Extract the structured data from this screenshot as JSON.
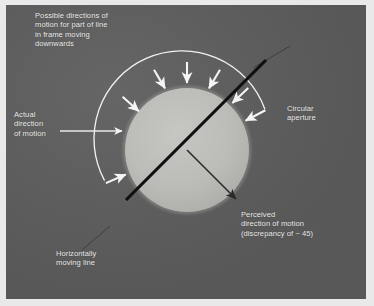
{
  "figure": {
    "panel_color": "#5d5d5d",
    "mount_color": "#e9e9e9",
    "aperture_fill": "#b9b9b6",
    "arc_color": "#f2f2f2",
    "arrow_color": "#f5f5f5",
    "line_color": "#111111",
    "percept_arrow_color": "#2b2b2b",
    "text_color": "#f0f0f0"
  },
  "labels": {
    "possible_directions": "Possible directions of\nmotion for part of line\nin frame moving\ndownwards",
    "actual_direction": "Actual\ndirection\nof motion",
    "horizontal_line": "Horizontally\nmoving line",
    "circular_aperture": "Circular\naperture",
    "perceived_direction": "Perceived\ndirection of motion\n(discrepancy of ~ 45)"
  },
  "geometry": {
    "aperture": {
      "cx": 187,
      "cy": 150,
      "r": 62
    },
    "arc": {
      "cx": 187,
      "cy": 150,
      "r": 88,
      "start_deg": 200,
      "end_deg": 332
    },
    "possible_arrows_deg": [
      203,
      226,
      248,
      270,
      292,
      314,
      333
    ],
    "actual_arrow": {
      "from_x": 60,
      "from_y": 131,
      "to_x": 123,
      "to_y": 131
    },
    "moving_line": {
      "x1": 127,
      "y1": 198,
      "x2": 265,
      "y2": 60,
      "angle_deg": -45
    },
    "percept_arrow": {
      "from_x": 187,
      "from_y": 150,
      "to_x": 238,
      "to_y": 201,
      "angle_deg": 45
    },
    "leader_aperture": {
      "x1": 258,
      "y1": 63,
      "x2": 290,
      "y2": 45
    },
    "leader_horizontal": {
      "x1": 105,
      "y1": 230,
      "x2": 82,
      "y2": 248
    }
  }
}
